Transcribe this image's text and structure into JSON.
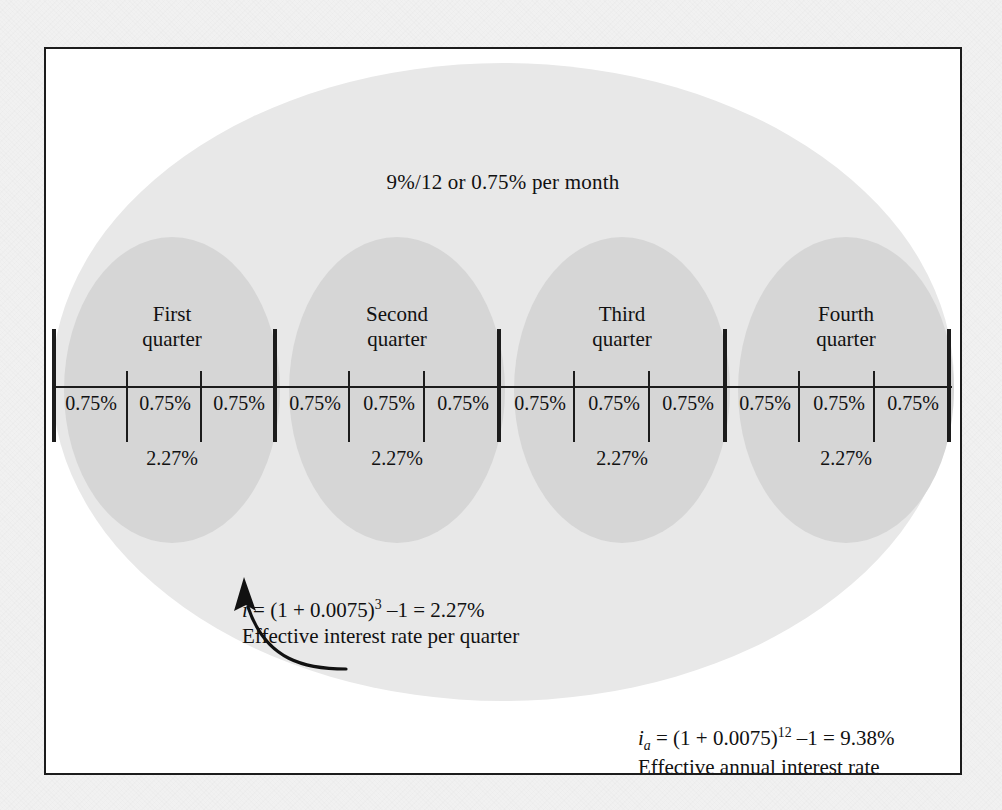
{
  "figure": {
    "top_rate_label": "9%/12 or 0.75% per month",
    "quarters": [
      {
        "title_line1": "First",
        "title_line2": "quarter",
        "rate": "2.27%",
        "months": [
          "0.75%",
          "0.75%",
          "0.75%"
        ]
      },
      {
        "title_line1": "Second",
        "title_line2": "quarter",
        "rate": "2.27%",
        "months": [
          "0.75%",
          "0.75%",
          "0.75%"
        ]
      },
      {
        "title_line1": "Third",
        "title_line2": "quarter",
        "rate": "2.27%",
        "months": [
          "0.75%",
          "0.75%",
          "0.75%"
        ]
      },
      {
        "title_line1": "Fourth",
        "title_line2": "quarter",
        "rate": "2.27%",
        "months": [
          "0.75%",
          "0.75%",
          "0.75%"
        ]
      }
    ],
    "quarter_formula": {
      "symbol": "i",
      "expression": " = (1 + 0.0075)",
      "exponent": "3",
      "tail": " –1 = 2.27%",
      "caption": "Effective interest rate per quarter"
    },
    "annual_formula": {
      "symbol": "i",
      "subscript": "a",
      "expression": " = (1 + 0.0075)",
      "exponent": "12",
      "tail": " –1 = 9.38%",
      "caption": "Effective annual interest rate"
    },
    "colors": {
      "page_background": "#f1f1f1",
      "panel_background": "#ffffff",
      "frame_border": "#1c1c1c",
      "outer_ellipse": "#e8e8e8",
      "quarter_ellipse": "#d6d6d6",
      "ink": "#111111"
    }
  }
}
